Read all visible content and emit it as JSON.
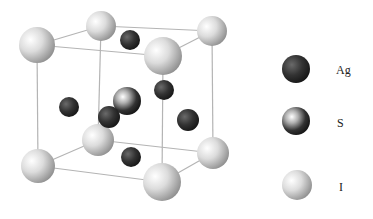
{
  "diagram": {
    "type": "crystal-unit-cell",
    "edge_color": "#b0b0b0",
    "corners": [
      {
        "name": "I-back-top-left",
        "x": 101,
        "y": 26,
        "r": 15
      },
      {
        "name": "I-back-top-right",
        "x": 212,
        "y": 31,
        "r": 15
      },
      {
        "name": "I-front-top-left",
        "x": 37,
        "y": 45,
        "r": 18
      },
      {
        "name": "I-front-top-right",
        "x": 163,
        "y": 56,
        "r": 19
      },
      {
        "name": "I-back-bottom-left",
        "x": 98,
        "y": 140,
        "r": 16
      },
      {
        "name": "I-back-bottom-right",
        "x": 213,
        "y": 153,
        "r": 16
      },
      {
        "name": "I-front-bottom-left",
        "x": 38,
        "y": 166,
        "r": 17
      },
      {
        "name": "I-front-bottom-right",
        "x": 162,
        "y": 182,
        "r": 19
      }
    ],
    "ag_atoms": [
      {
        "x": 130,
        "y": 40,
        "r": 10
      },
      {
        "x": 164,
        "y": 90,
        "r": 10
      },
      {
        "x": 69,
        "y": 107,
        "r": 10
      },
      {
        "x": 109,
        "y": 117,
        "r": 11
      },
      {
        "x": 188,
        "y": 120,
        "r": 11
      },
      {
        "x": 131,
        "y": 157,
        "r": 10
      }
    ],
    "s_atoms": [
      {
        "x": 127,
        "y": 101,
        "r": 14
      }
    ]
  },
  "legend": {
    "items": [
      {
        "label": "Ag",
        "type": "ag",
        "x": 296,
        "y": 69,
        "r": 14,
        "label_x": 336,
        "label_y": 63
      },
      {
        "label": "S",
        "type": "s",
        "x": 296,
        "y": 121,
        "r": 14,
        "label_x": 337,
        "label_y": 116
      },
      {
        "label": "I",
        "type": "i",
        "x": 297,
        "y": 185,
        "r": 15,
        "label_x": 339,
        "label_y": 180
      }
    ]
  },
  "colors": {
    "ag_light": "#7a7a7a",
    "ag_dark": "#1e1e1e",
    "s_light": "#ffffff",
    "s_mid": "#7a7a7a",
    "s_dark": "#151515",
    "i_light": "#ffffff",
    "i_mid": "#d8d8d8",
    "i_dark": "#8e8e8e"
  }
}
